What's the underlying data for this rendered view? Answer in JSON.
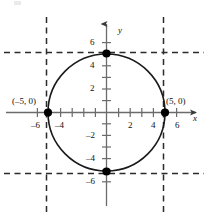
{
  "figure": {
    "colors": {
      "curve": "#1a1a1a",
      "axis": "#6b6b6b",
      "dashed": "#2b2b2b",
      "point": "#000000",
      "text": "#111111",
      "background": "#ffffff"
    },
    "axes": {
      "x_name": "x",
      "y_name": "y",
      "x_ticks": [
        {
          "value": -6,
          "label": "–6"
        },
        {
          "value": -5,
          "label": ""
        },
        {
          "value": -4,
          "label": "–4"
        },
        {
          "value": -3,
          "label": ""
        },
        {
          "value": -2,
          "label": ""
        },
        {
          "value": -1,
          "label": ""
        },
        {
          "value": 1,
          "label": ""
        },
        {
          "value": 2,
          "label": "2"
        },
        {
          "value": 3,
          "label": ""
        },
        {
          "value": 4,
          "label": "4"
        },
        {
          "value": 5,
          "label": ""
        },
        {
          "value": 6,
          "label": "6"
        }
      ],
      "y_ticks": [
        {
          "value": 6,
          "label": "6"
        },
        {
          "value": 5,
          "label": ""
        },
        {
          "value": 4,
          "label": "4"
        },
        {
          "value": 3,
          "label": ""
        },
        {
          "value": 2,
          "label": "2"
        },
        {
          "value": 1,
          "label": ""
        },
        {
          "value": -1,
          "label": ""
        },
        {
          "value": -2,
          "label": "–2"
        },
        {
          "value": -3,
          "label": ""
        },
        {
          "value": -4,
          "label": "–4"
        },
        {
          "value": -5,
          "label": ""
        },
        {
          "value": -6,
          "label": "–6"
        }
      ]
    },
    "curve": {
      "type": "circle",
      "center": [
        0,
        0
      ],
      "radius": 5,
      "equation": "x^2 + y^2 = 25"
    },
    "points": [
      {
        "x": -5,
        "y": 0,
        "label": "(–5, 0)",
        "marked": true
      },
      {
        "x": 5,
        "y": 0,
        "label": "(5, 0)",
        "marked": true
      },
      {
        "x": 0,
        "y": 5,
        "label": "",
        "marked": true
      },
      {
        "x": 0,
        "y": -5,
        "label": "",
        "marked": true
      }
    ],
    "dashed_lines": [
      {
        "orientation": "vertical",
        "value": -5
      },
      {
        "orientation": "vertical",
        "value": 5
      },
      {
        "orientation": "horizontal",
        "value": 5
      },
      {
        "orientation": "horizontal",
        "value": -5
      }
    ]
  }
}
